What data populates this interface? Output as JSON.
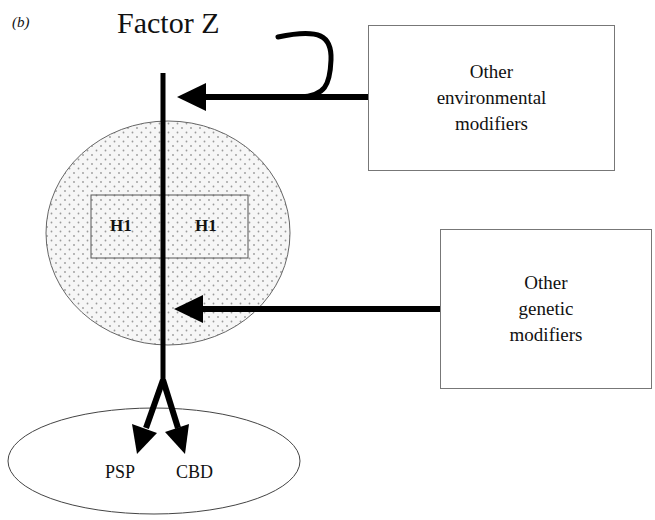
{
  "figure": {
    "panel_label": "(b)",
    "title": "Factor Z"
  },
  "boxes": {
    "environmental": {
      "lines": [
        "Other",
        "environmental",
        "modifiers"
      ]
    },
    "genetic": {
      "lines": [
        "Other",
        "genetic",
        "modifiers"
      ]
    }
  },
  "haplotype": {
    "left": "H1",
    "right": "H1"
  },
  "outcomes": {
    "left": "PSP",
    "right": "CBD"
  },
  "colors": {
    "line": "#000000",
    "stipple_fill": "#f4f4f4",
    "stipple_dot": "#9a9a9a",
    "box_border": "#777777"
  }
}
